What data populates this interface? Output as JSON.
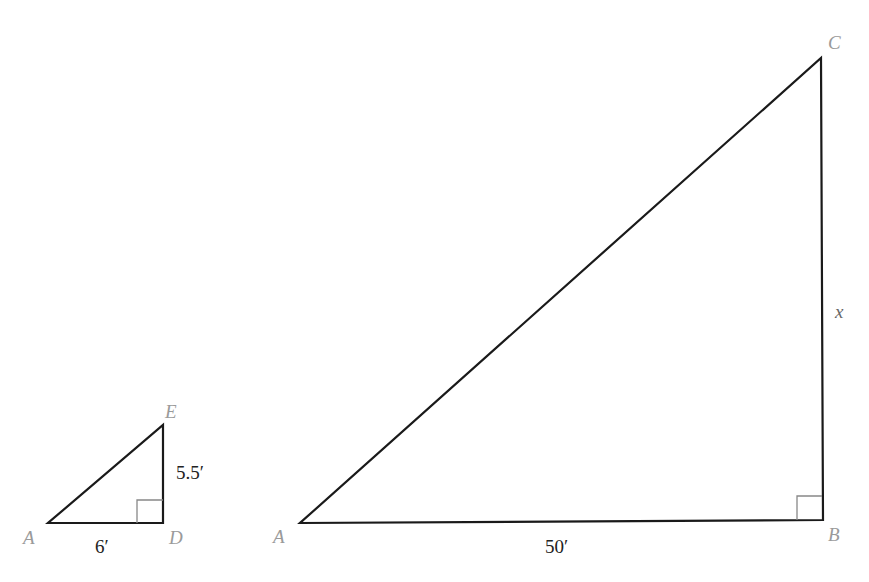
{
  "figure": {
    "type": "similar-right-triangles",
    "small_triangle": {
      "vertices": {
        "left": "A",
        "right_angle": "D",
        "top": "E"
      },
      "sides": {
        "base": "6′",
        "height": "5.5′"
      }
    },
    "large_triangle": {
      "vertices": {
        "left": "A",
        "right_angle": "B",
        "top": "C"
      },
      "sides": {
        "base": "50′",
        "height": "x"
      }
    },
    "colors": {
      "stroke": "#1a1a1a",
      "right_angle_marker": "#888888",
      "vertex_label": "#9a9a9a",
      "measure_label": "#222222"
    }
  }
}
